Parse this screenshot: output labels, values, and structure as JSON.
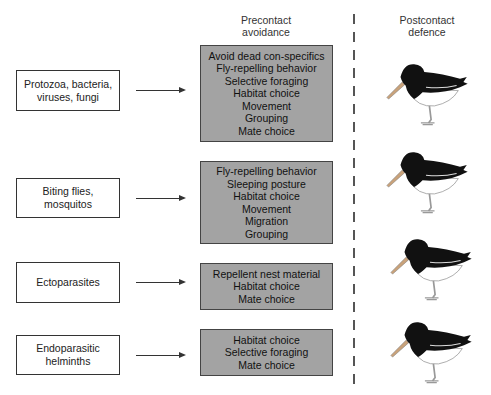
{
  "headers": {
    "precontact": [
      "Precontact",
      "avoidance"
    ],
    "postcontact": [
      "Postcontact",
      "defence"
    ]
  },
  "rows": [
    {
      "parasite": [
        "Protozoa, bacteria,",
        "viruses, fungi"
      ],
      "avoidance": [
        "Avoid dead con-specifics",
        "Fly-repelling behavior",
        "Selective foraging",
        "Habitat choice",
        "Movement",
        "Grouping",
        "Mate choice"
      ],
      "defence_icon": "oystercatcher-bird-icon"
    },
    {
      "parasite": [
        "Biting flies,",
        "mosquitos"
      ],
      "avoidance": [
        "Fly-repelling behavior",
        "Sleeping posture",
        "Habitat choice",
        "Movement",
        "Migration",
        "Grouping"
      ],
      "defence_icon": "oystercatcher-bird-icon"
    },
    {
      "parasite": [
        "Ectoparasites"
      ],
      "avoidance": [
        "Repellent nest material",
        "Habitat choice",
        "Mate choice"
      ],
      "defence_icon": "oystercatcher-bird-icon"
    },
    {
      "parasite": [
        "Endoparasitic",
        "helminths"
      ],
      "avoidance": [
        "Habitat choice",
        "Selective foraging",
        "Mate choice"
      ],
      "defence_icon": "oystercatcher-bird-icon"
    }
  ],
  "colors": {
    "avoidance_box_fill": "#a3a3a3",
    "box_border": "#444444",
    "bird_body": "#111111"
  }
}
